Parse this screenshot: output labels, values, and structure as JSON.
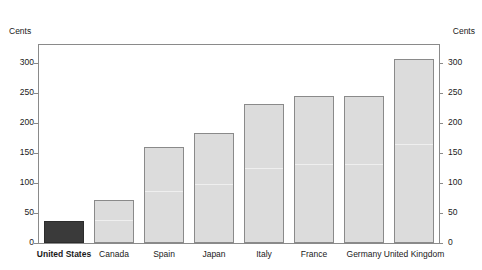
{
  "axis": {
    "unit_caption_left": "Cents",
    "unit_caption_right": "Cents"
  },
  "chart_data": {
    "type": "bar",
    "title": "",
    "subtitle": "",
    "xlabel": "",
    "ylabel": "Cents",
    "ylabel_right": "Cents",
    "ylim": [
      0,
      330
    ],
    "yticks": [
      0,
      50,
      100,
      150,
      200,
      250,
      300
    ],
    "ytick_labels": [
      "0",
      "50",
      "100",
      "150",
      "200",
      "250",
      "300"
    ],
    "grid": false,
    "legend": "none",
    "dual_axis": true,
    "categories": [
      "United States",
      "Canada",
      "Spain",
      "Japan",
      "Italy",
      "France",
      "Germany",
      "United Kingdom"
    ],
    "values": [
      37,
      71,
      160,
      183,
      232,
      245,
      245,
      307
    ],
    "highlight_category": "United States",
    "colors": {
      "bar_default_fill": "#dcdcdc",
      "bar_highlight_fill": "#3a3a3a",
      "bar_edge": "#8a8a8a",
      "frame": "#8a8a8a",
      "text": "#1a1a1a",
      "background": "#ffffff"
    }
  }
}
